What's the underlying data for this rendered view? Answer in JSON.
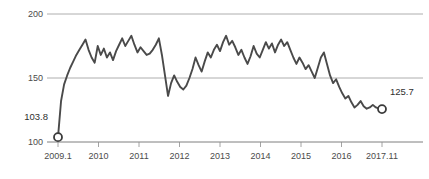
{
  "chart_data": {
    "type": "line",
    "title": "",
    "subtitle": "",
    "xlabel": "",
    "ylabel": "",
    "ylim": [
      100,
      200
    ],
    "yticks": [
      100,
      150,
      200
    ],
    "ytick_labels": [
      "100",
      "150",
      "200"
    ],
    "grid": true,
    "legend": null,
    "xtick_labels": [
      "2009.1",
      "2010",
      "2011",
      "2012",
      "2013",
      "2014",
      "2015",
      "2016",
      "2017.11"
    ],
    "x_start": "2009.1",
    "x_end": "2017.11",
    "x_frequency": "monthly",
    "annotations": [
      {
        "name": "start-value",
        "label": "103.8",
        "value": 103.8,
        "x": "2009.1"
      },
      {
        "name": "end-value",
        "label": "125.7",
        "value": 125.7,
        "x": "2017.11"
      }
    ],
    "markers": [
      {
        "name": "start-marker",
        "x": "2009.1",
        "value": 103.8
      },
      {
        "name": "end-marker",
        "x": "2017.11",
        "value": 125.7
      }
    ],
    "series": [
      {
        "name": "index",
        "color": "#4a4a4a",
        "values": [
          103.8,
          132.0,
          145.0,
          152.0,
          158.0,
          163.0,
          168.0,
          172.0,
          176.0,
          180.0,
          172.0,
          166.0,
          162.0,
          175.0,
          168.0,
          173.0,
          166.0,
          170.0,
          164.0,
          171.0,
          176.0,
          181.0,
          175.0,
          179.0,
          183.0,
          176.0,
          170.0,
          174.0,
          171.0,
          168.0,
          169.0,
          172.0,
          176.0,
          181.0,
          168.0,
          152.0,
          136.0,
          146.0,
          152.0,
          147.0,
          143.0,
          141.0,
          144.0,
          150.0,
          157.0,
          166.0,
          160.0,
          155.0,
          163.0,
          170.0,
          166.0,
          172.0,
          176.0,
          171.0,
          178.0,
          183.0,
          176.0,
          179.0,
          174.0,
          168.0,
          172.0,
          166.0,
          161.0,
          167.0,
          175.0,
          169.0,
          166.0,
          172.0,
          178.0,
          173.0,
          177.0,
          170.0,
          176.0,
          180.0,
          175.0,
          178.0,
          172.0,
          166.0,
          161.0,
          166.0,
          162.0,
          157.0,
          160.0,
          155.0,
          150.0,
          158.0,
          166.0,
          170.0,
          161.0,
          152.0,
          146.0,
          149.0,
          143.0,
          138.0,
          134.0,
          136.0,
          131.0,
          127.0,
          129.0,
          132.0,
          128.0,
          126.0,
          127.0,
          129.0,
          127.0,
          126.0,
          125.7
        ]
      }
    ]
  }
}
